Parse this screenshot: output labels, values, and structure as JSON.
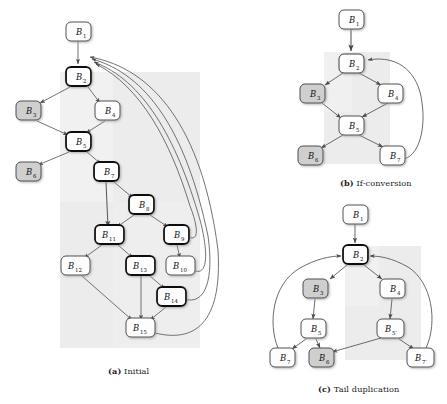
{
  "figure": {
    "background": "#ffffff",
    "node_fill_white": "#fdfdfd",
    "node_fill_grey": "#cfcfcf",
    "node_stroke": "#3a3a3a",
    "edge_color": "#555555",
    "region_fill": "#ececec"
  },
  "panels": [
    {
      "id": "a",
      "caption_label": "(a)",
      "caption_text": "Initial",
      "caption_x": 108,
      "caption_y": 368,
      "region": {
        "x": 60,
        "y": 72,
        "width": 140,
        "height": 276
      },
      "nodes": [
        {
          "id": "B1",
          "label": "B",
          "sub": "1",
          "x": 78,
          "y": 31,
          "style": "white"
        },
        {
          "id": "B2",
          "label": "B",
          "sub": "2",
          "x": 78,
          "y": 77,
          "style": "bold"
        },
        {
          "id": "B3",
          "label": "B",
          "sub": "3",
          "x": 28,
          "y": 111,
          "style": "grey"
        },
        {
          "id": "B4",
          "label": "B",
          "sub": "4",
          "x": 107,
          "y": 111,
          "style": "white"
        },
        {
          "id": "B5",
          "label": "B",
          "sub": "5",
          "x": 78,
          "y": 142,
          "style": "bold"
        },
        {
          "id": "B6",
          "label": "B",
          "sub": "6",
          "x": 28,
          "y": 172,
          "style": "grey"
        },
        {
          "id": "B7",
          "label": "B",
          "sub": "7",
          "x": 106,
          "y": 172,
          "style": "bold"
        },
        {
          "id": "B8",
          "label": "B",
          "sub": "8",
          "x": 141,
          "y": 205,
          "style": "bold"
        },
        {
          "id": "B11",
          "label": "B",
          "sub": "11",
          "x": 110,
          "y": 235,
          "style": "bold"
        },
        {
          "id": "B9",
          "label": "B",
          "sub": "9",
          "x": 176,
          "y": 235,
          "style": "bold"
        },
        {
          "id": "B12",
          "label": "B",
          "sub": "12",
          "x": 76,
          "y": 266,
          "style": "white"
        },
        {
          "id": "B13",
          "label": "B",
          "sub": "13",
          "x": 141,
          "y": 266,
          "style": "bold"
        },
        {
          "id": "B10",
          "label": "B",
          "sub": "10",
          "x": 181,
          "y": 266,
          "style": "white"
        },
        {
          "id": "B14",
          "label": "B",
          "sub": "14",
          "x": 172,
          "y": 297,
          "style": "bold"
        },
        {
          "id": "B15",
          "label": "B",
          "sub": "15",
          "x": 141,
          "y": 328,
          "style": "white"
        }
      ],
      "edges": [
        "B1->B2",
        "B2->B3",
        "B2->B4",
        "B3->B5",
        "B4->B5",
        "B5->B6",
        "B5->B7",
        "B7->B8",
        "B7->B11",
        "B8->B11",
        "B8->B9",
        "B9->B10",
        "B11->B12",
        "B11->B13",
        "B13->B14",
        "B13->B15",
        "B12->B15",
        "B14->B15",
        "B9->B2 (back)",
        "B10->B2 (back)",
        "B14->B2 (back)",
        "B15->B2 (back)"
      ]
    },
    {
      "id": "b",
      "caption_label": "(b)",
      "caption_text": "If-conversion",
      "caption_x": 340,
      "caption_y": 181,
      "region": {
        "x": 322,
        "y": 52,
        "width": 72,
        "height": 112
      },
      "nodes": [
        {
          "id": "B1",
          "label": "B",
          "sub": "1",
          "x": 351,
          "y": 19,
          "style": "white"
        },
        {
          "id": "B2",
          "label": "B",
          "sub": "2",
          "x": 351,
          "y": 63,
          "style": "white"
        },
        {
          "id": "B3",
          "label": "B",
          "sub": "3",
          "x": 313,
          "y": 93,
          "style": "grey"
        },
        {
          "id": "B4",
          "label": "B",
          "sub": "4",
          "x": 390,
          "y": 93,
          "style": "white"
        },
        {
          "id": "B5",
          "label": "B",
          "sub": "5",
          "x": 351,
          "y": 125,
          "style": "white"
        },
        {
          "id": "B6",
          "label": "B",
          "sub": "6",
          "x": 310,
          "y": 155,
          "style": "grey"
        },
        {
          "id": "B7",
          "label": "B",
          "sub": "7",
          "x": 392,
          "y": 155,
          "style": "white"
        }
      ],
      "edges": [
        "B1->B2",
        "B2->B3",
        "B2->B4",
        "B3->B5",
        "B4->B5",
        "B5->B6",
        "B5->B7",
        "B7->B2 (back)"
      ]
    },
    {
      "id": "c",
      "caption_label": "(c)",
      "caption_text": "Tail duplication",
      "caption_x": 318,
      "caption_y": 387,
      "region": {
        "x": 343,
        "y": 246,
        "width": 78,
        "height": 114
      },
      "nodes": [
        {
          "id": "B1",
          "label": "B",
          "sub": "1",
          "x": 355,
          "y": 214,
          "style": "white"
        },
        {
          "id": "B2",
          "label": "B",
          "sub": "2",
          "x": 355,
          "y": 254,
          "style": "bold"
        },
        {
          "id": "B3",
          "label": "B",
          "sub": "3",
          "x": 315,
          "y": 288,
          "style": "grey"
        },
        {
          "id": "B4",
          "label": "B",
          "sub": "4",
          "x": 392,
          "y": 288,
          "style": "white"
        },
        {
          "id": "B5",
          "label": "B",
          "sub": "5",
          "x": 313,
          "y": 328,
          "style": "white"
        },
        {
          "id": "B5p",
          "label": "B",
          "sub": "5′",
          "x": 390,
          "y": 328,
          "style": "white"
        },
        {
          "id": "B7",
          "label": "B",
          "sub": "7",
          "x": 282,
          "y": 357,
          "style": "white"
        },
        {
          "id": "B6",
          "label": "B",
          "sub": "6",
          "x": 321,
          "y": 357,
          "style": "grey"
        },
        {
          "id": "B7p",
          "label": "B",
          "sub": "7′",
          "x": 420,
          "y": 357,
          "style": "white"
        }
      ],
      "edges": [
        "B1->B2",
        "B2->B3",
        "B2->B4",
        "B3->B5",
        "B4->B5p",
        "B5->B7",
        "B5->B6",
        "B5p->B6",
        "B5p->B7p",
        "B7->B2 (back)",
        "B7p->B2 (back)"
      ]
    }
  ]
}
